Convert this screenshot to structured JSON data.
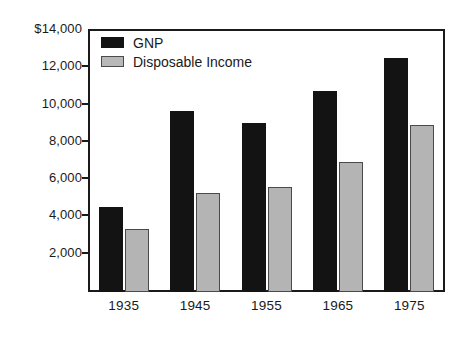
{
  "chart_data": {
    "type": "bar",
    "title": "",
    "subtitle": "",
    "xlabel": "",
    "ylabel": "",
    "categories": [
      "1935",
      "1945",
      "1955",
      "1965",
      "1975"
    ],
    "series": [
      {
        "name": "GNP",
        "color": "#131313",
        "values": [
          4550,
          9700,
          9050,
          10800,
          12550
        ]
      },
      {
        "name": "Disposable Income",
        "color": "#b4b4b4",
        "values": [
          3400,
          5300,
          5650,
          7000,
          8950
        ]
      }
    ],
    "ylim": [
      0,
      14000
    ],
    "y_ticks": [
      2000,
      4000,
      6000,
      8000,
      10000,
      12000,
      14000
    ],
    "y_tick_labels": [
      "2,000",
      "4,000",
      "6,000",
      "8,000",
      "10,000",
      "12,000",
      "$14,000"
    ],
    "grid": false,
    "legend_position": "top-left",
    "currency_symbol": "$"
  },
  "legend": {
    "items": [
      {
        "label": "GNP",
        "swatch": "black-square-swatch"
      },
      {
        "label": "Disposable Income",
        "swatch": "gray-square-swatch"
      }
    ]
  }
}
